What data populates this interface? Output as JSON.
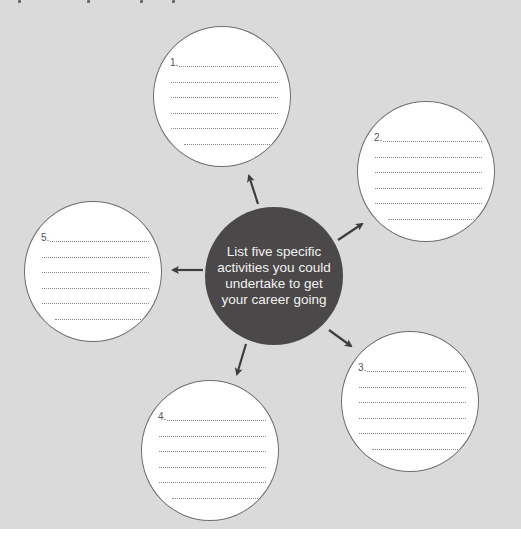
{
  "diagram": {
    "type": "hub-and-spoke worksheet",
    "background_color": "#dadada",
    "hub": {
      "text": "List five specific activities you could undertake to get your career going",
      "color": "#4a4848",
      "text_color": "#f2f2f2"
    },
    "bubbles": [
      {
        "id": 1,
        "label": "1.",
        "lines": 6,
        "cx": 222,
        "cy": 97
      },
      {
        "id": 2,
        "label": "2.",
        "lines": 6,
        "cx": 426,
        "cy": 171
      },
      {
        "id": 3,
        "label": "3.",
        "lines": 6,
        "cx": 410,
        "cy": 402
      },
      {
        "id": 4,
        "label": "4.",
        "lines": 6,
        "cx": 210,
        "cy": 451
      },
      {
        "id": 5,
        "label": "5.",
        "lines": 6,
        "cx": 93,
        "cy": 272
      }
    ],
    "arrows": [
      {
        "to": 1,
        "icon": "arrow-up-left-icon"
      },
      {
        "to": 2,
        "icon": "arrow-up-right-icon"
      },
      {
        "to": 3,
        "icon": "arrow-down-right-icon"
      },
      {
        "to": 4,
        "icon": "arrow-down-left-icon"
      },
      {
        "to": 5,
        "icon": "arrow-left-icon"
      }
    ]
  }
}
